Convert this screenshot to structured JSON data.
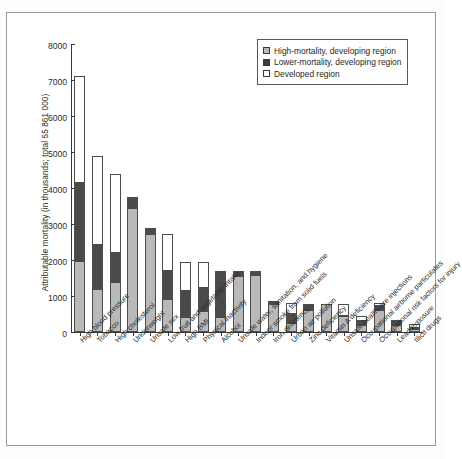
{
  "chart_data": {
    "type": "bar",
    "stacked": true,
    "title": "",
    "xlabel": "",
    "ylabel": "Attributable mortality (in thousands; total 55 861 000)",
    "ylim": [
      0,
      8000
    ],
    "yticks": [
      0,
      1000,
      2000,
      3000,
      4000,
      5000,
      6000,
      7000,
      8000
    ],
    "grid": false,
    "legend_position": "top-right",
    "categories": [
      "High blood pressure",
      "Tobacco",
      "High cholesterol",
      "Underweight",
      "Unsafe sex",
      "Low fruit and vegetable intake",
      "High BMI",
      "Physical inactivity",
      "Alcohol",
      "Unsafe water, sanitation, and hygiene",
      "Indoor smoke from solid fuels",
      "Iron deficiency",
      "Urban air pollution",
      "Zinc deficiency",
      "Vitamin A deficiency",
      "Unsafe healthcare injections",
      "Occupational airborne particulates",
      "Occupational risk factors for injury",
      "Lead exposure",
      "Illicit drugs"
    ],
    "series": [
      {
        "name": "High-mortality, developing region",
        "color": "#b9b9b9",
        "values": [
          1940,
          1170,
          1350,
          3410,
          2700,
          900,
          390,
          560,
          390,
          1520,
          1560,
          760,
          210,
          580,
          760,
          420,
          170,
          570,
          180,
          60
        ]
      },
      {
        "name": "Lower-mortality, developing region",
        "color": "#4a4a4a",
        "values": [
          2230,
          1280,
          880,
          340,
          160,
          810,
          790,
          700,
          1300,
          180,
          130,
          70,
          310,
          200,
          10,
          40,
          160,
          180,
          130,
          80
        ]
      },
      {
        "name": "Developed region",
        "color": "#ffffff",
        "values": [
          2950,
          2440,
          2150,
          0,
          20,
          1000,
          760,
          680,
          0,
          0,
          0,
          20,
          280,
          0,
          0,
          330,
          120,
          50,
          30,
          70
        ]
      }
    ],
    "totals": [
      7120,
      4890,
      4380,
      3750,
      2880,
      2710,
      1940,
      1940,
      1690,
      1700,
      1690,
      850,
      800,
      780,
      770,
      790,
      450,
      800,
      340,
      210
    ]
  },
  "legend": {
    "items": [
      {
        "label": "High-mortality, developing region",
        "swatch": "high"
      },
      {
        "label": "Lower-mortality, developing region",
        "swatch": "lower"
      },
      {
        "label": "Developed region",
        "swatch": "dev"
      }
    ]
  },
  "colors": {
    "high_mortality": "#b9b9b9",
    "lower_mortality": "#4a4a4a",
    "developed": "#ffffff",
    "axis": "#3a3a3a",
    "text": "#2b2b2b",
    "frame": "#9a9a9a"
  }
}
